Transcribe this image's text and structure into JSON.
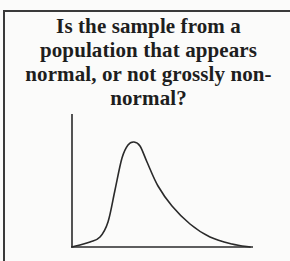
{
  "card": {
    "question_lines": [
      "Is the sample from a",
      "population that appears",
      "normal, or not grossly non-",
      "normal?"
    ]
  },
  "chart_data": {
    "type": "line",
    "title": "",
    "xlabel": "",
    "ylabel": "",
    "grid": false,
    "legend": null,
    "curve_points_px": [
      [
        72,
        247
      ],
      [
        90,
        242
      ],
      [
        100,
        237
      ],
      [
        108,
        222
      ],
      [
        115,
        190
      ],
      [
        122,
        158
      ],
      [
        128,
        145
      ],
      [
        134,
        142
      ],
      [
        140,
        146
      ],
      [
        147,
        162
      ],
      [
        158,
        186
      ],
      [
        172,
        206
      ],
      [
        190,
        224
      ],
      [
        210,
        237
      ],
      [
        232,
        244
      ],
      [
        250,
        247
      ]
    ]
  },
  "colors": {
    "ink": "#2a2a2a",
    "paper": "#fbfbfa"
  }
}
